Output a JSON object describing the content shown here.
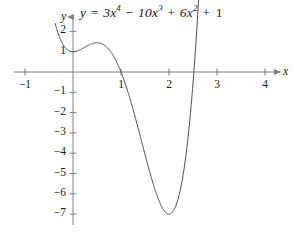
{
  "figure": {
    "title_equation_plain": "y = 3x^4 - 10x^3 + 6x^2 + 1",
    "equation_parts": {
      "lhs": "y",
      "equals": "=",
      "t1_coef": "3",
      "t1_var": "x",
      "t1_exp": "4",
      "op1": "−",
      "t2_coef": "10",
      "t2_var": "x",
      "t2_exp": "3",
      "op2": "+",
      "t3_coef": "6",
      "t3_var": "x",
      "t3_exp": "2",
      "op3": "+",
      "t4_const": "1"
    },
    "x_axis_name": "x",
    "y_axis_name": "y",
    "curve_color": "#4d4d4d",
    "axis_color": "#808080",
    "text_color": "#1a1a1a",
    "background_color": "#ffffff"
  },
  "chart_data": {
    "type": "line",
    "xlabel": "x",
    "ylabel": "y",
    "xlim": [
      -1.25,
      4.4
    ],
    "ylim": [
      -7.8,
      2.8
    ],
    "grid": false,
    "legend": false,
    "function": "3*x^4 - 10*x^3 + 6*x^2 + 1",
    "domain_drawn": [
      -0.37,
      2.62
    ],
    "x_ticks": [
      -1,
      1,
      2,
      3,
      4
    ],
    "x_tick_labels": [
      "−1",
      "1",
      "2",
      "3",
      "4"
    ],
    "y_ticks": [
      2,
      1,
      -1,
      -2,
      -3,
      -4,
      -5,
      -6,
      -7
    ],
    "y_tick_labels": [
      "2",
      "1",
      "−1",
      "−2",
      "−3",
      "−4",
      "−5",
      "−6",
      "−7"
    ],
    "features": {
      "y_intercept": 1,
      "local_maximum": [
        0.55,
        1.4
      ],
      "global_minimum": [
        2.04,
        -7.1
      ],
      "x_intercepts": [
        1.15,
        2.57
      ]
    },
    "x": [
      -0.37,
      -0.3,
      -0.2,
      -0.1,
      0,
      0.1,
      0.2,
      0.3,
      0.4,
      0.5,
      0.55,
      0.6,
      0.7,
      0.8,
      0.9,
      1,
      1.1,
      1.15,
      1.2,
      1.3,
      1.4,
      1.5,
      1.6,
      1.7,
      1.8,
      1.9,
      2,
      2.04,
      2.1,
      2.2,
      2.3,
      2.4,
      2.5,
      2.57,
      2.6,
      2.62
    ],
    "y": [
      2.4,
      1.78,
      1.32,
      1.07,
      1,
      1.05,
      1.16,
      1.29,
      1.38,
      1.44,
      1.45,
      1.44,
      1.37,
      1.2,
      0.9,
      0,
      0.33,
      0.0,
      -0.36,
      -1.26,
      -2.35,
      -3.5,
      -4.63,
      -5.65,
      -6.45,
      -6.96,
      -7.1,
      -7.1,
      -7.03,
      -6.6,
      -5.72,
      -4.3,
      -2.19,
      0.0,
      0.83,
      1.25
    ]
  }
}
